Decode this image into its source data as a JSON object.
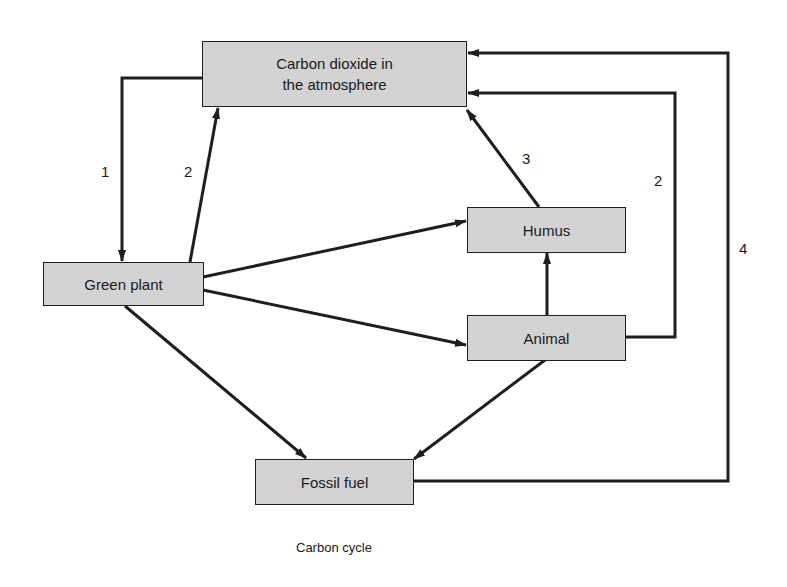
{
  "diagram": {
    "title": "Carbon cycle",
    "nodes": {
      "co2": {
        "label": "Carbon dioxide in the atmosphere",
        "line1": "Carbon dioxide in",
        "line2": "the atmosphere"
      },
      "green_plant": {
        "label": "Green plant"
      },
      "humus": {
        "label": "Humus"
      },
      "animal": {
        "label": "Animal"
      },
      "fossil_fuel": {
        "label": "Fossil fuel"
      }
    },
    "edges": [
      {
        "from": "Carbon dioxide in the atmosphere",
        "to": "Green plant",
        "label": "1"
      },
      {
        "from": "Green plant",
        "to": "Carbon dioxide in the atmosphere",
        "label": "2"
      },
      {
        "from": "Humus",
        "to": "Carbon dioxide in the atmosphere",
        "label": "3"
      },
      {
        "from": "Animal",
        "to": "Carbon dioxide in the atmosphere",
        "label": "2"
      },
      {
        "from": "Fossil fuel",
        "to": "Carbon dioxide in the atmosphere",
        "label": "4"
      },
      {
        "from": "Green plant",
        "to": "Humus",
        "label": ""
      },
      {
        "from": "Green plant",
        "to": "Animal",
        "label": ""
      },
      {
        "from": "Green plant",
        "to": "Fossil fuel",
        "label": ""
      },
      {
        "from": "Animal",
        "to": "Humus",
        "label": ""
      },
      {
        "from": "Animal",
        "to": "Fossil fuel",
        "label": ""
      }
    ],
    "edge_labels": {
      "l1": "1",
      "l2_left": "2",
      "l3": "3",
      "l2_right": "2",
      "l4": "4"
    },
    "colors": {
      "box_fill": "#d3d3d3",
      "stroke": "#1e1e1e",
      "background": "#ffffff"
    }
  }
}
